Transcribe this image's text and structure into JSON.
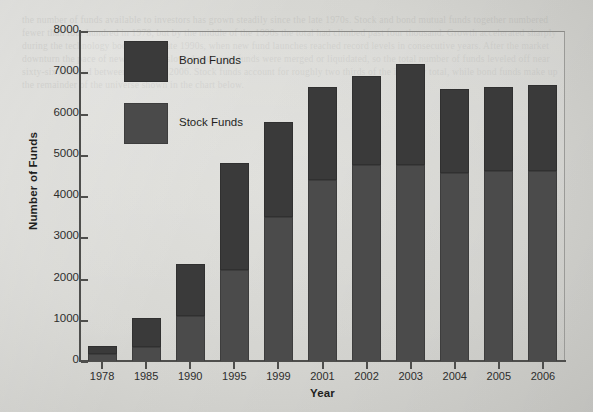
{
  "chart_data": {
    "type": "bar",
    "subtype": "stacked-bar",
    "title": "",
    "xlabel": "Year",
    "ylabel": "Number of Funds",
    "ylim": [
      0,
      8000
    ],
    "ytick_values": [
      0,
      1000,
      2000,
      3000,
      4000,
      5000,
      6000,
      7000,
      8000
    ],
    "ytick_labels": [
      "0",
      "1000",
      "2000",
      "3000",
      "4000",
      "5000",
      "6000",
      "7000",
      "8000"
    ],
    "grid": false,
    "legend_position": "upper-left-inside",
    "categories": [
      "1978",
      "1985",
      "1990",
      "1995",
      "1999",
      "2001",
      "2002",
      "2003",
      "2004",
      "2005",
      "2006"
    ],
    "series": [
      {
        "name": "Stock Funds",
        "color": "#4b4b4b",
        "values": [
          180,
          350,
          1100,
          2200,
          3500,
          4400,
          4750,
          4750,
          4550,
          4600,
          4600
        ]
      },
      {
        "name": "Bond Funds",
        "color": "#3a3a3a",
        "values": [
          190,
          690,
          1250,
          2600,
          2300,
          2250,
          2150,
          2450,
          2050,
          2050,
          2100
        ]
      }
    ],
    "totals": [
      370,
      1040,
      2350,
      4800,
      5800,
      6650,
      6900,
      7200,
      6600,
      6650,
      6700
    ]
  },
  "legend": {
    "items": [
      {
        "label": "Bond Funds",
        "swatch": "bond-swatch",
        "color": "#3a3a3a"
      },
      {
        "label": "Stock Funds",
        "swatch": "stock-swatch",
        "color": "#4a4a4a"
      }
    ]
  },
  "page": {
    "background_color": "#d9d9d6",
    "ghost_text": "the number of funds available to investors has grown steadily since the late 1970s. Stock and bond mutual funds together numbered fewer than four hundred in 1978, but by the middle of the 1990s the total had climbed past four thousand. Growth accelerated sharply during the technology boom of the late 1990s, when new fund launches reached record levels in consecutive years. After the market downturn the pace of new offerings slowed and some funds were merged or liquidated, so the total number of funds leveled off near sixty-six hundred between 2004 and 2006. Stock funds account for roughly two thirds of the industry total, while bond funds make up the remainder of the universe shown in the chart below."
  }
}
